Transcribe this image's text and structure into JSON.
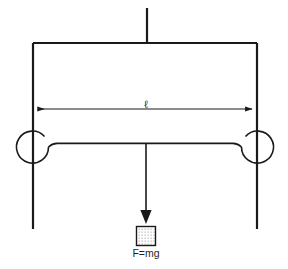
{
  "figure": {
    "background_color": "#ffffff",
    "line_color": "#1a1a1a",
    "width": 288,
    "height": 269
  },
  "labels": {
    "span_label": "ℓ",
    "force_label": "F=mg"
  },
  "elements": {
    "top_support_label": "top-support-line",
    "beam_label": "horizontal-beam",
    "left_post_label": "left-vertical-post",
    "right_post_label": "right-vertical-post",
    "left_pulley_label": "left-pulley",
    "right_pulley_label": "right-pulley",
    "rope_label": "horizontal-rope",
    "force_arrow_label": "downward-force-arrow",
    "mass_block_label": "hanging-mass-block",
    "dimension_line_label": "span-dimension-line"
  },
  "geometry": {
    "top_support_x": 147,
    "top_support_y_top": 8,
    "beam_y": 43,
    "left_post_x": 33,
    "right_post_x": 257,
    "post_y_bottom": 229,
    "dimension_y": 109,
    "pulley_cy": 147,
    "pulley_r": 16,
    "rope_y": 144,
    "arrow_tip_y": 222,
    "block_x": 136,
    "block_y": 226,
    "block_size": 19
  }
}
